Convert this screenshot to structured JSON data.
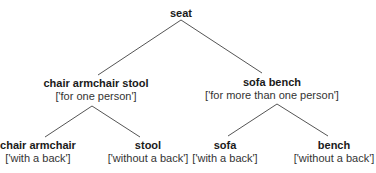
{
  "diagram": {
    "type": "tree",
    "root": {
      "label": "seat",
      "children": [
        {
          "label": "chair armchair stool",
          "feature": "['for one person']",
          "children": [
            {
              "label": "chair armchair",
              "feature": "['with a back']"
            },
            {
              "label": "stool",
              "feature": "['without a back']"
            }
          ]
        },
        {
          "label": "sofa bench",
          "feature": "['for more than one person']",
          "children": [
            {
              "label": "sofa",
              "feature": "['with a back']"
            },
            {
              "label": "bench",
              "feature": "['without a back']"
            }
          ]
        }
      ]
    },
    "colors": {
      "edge": "#555555",
      "text": "#1a1a1a",
      "background": "#ffffff"
    }
  }
}
